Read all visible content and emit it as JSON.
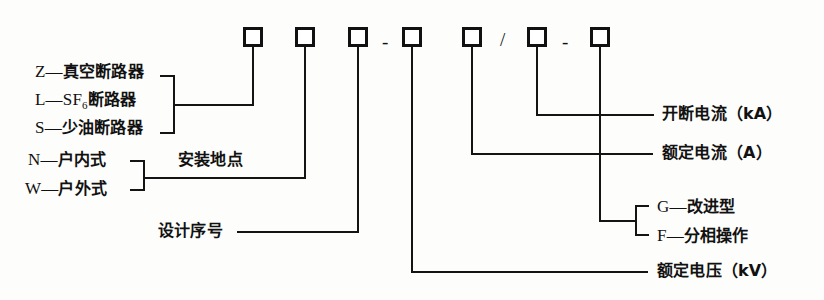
{
  "diagram": {
    "type": "callout-diagram",
    "background_color": "#fdfdfb",
    "line_color": "#141414"
  },
  "code_row": {
    "slots": [
      {
        "id": "slot-1",
        "meaning_ref": "breaker_type"
      },
      {
        "id": "slot-2",
        "meaning_ref": "install_location"
      },
      {
        "id": "slot-3",
        "meaning_ref": "design_serial"
      },
      {
        "id": "slot-4",
        "meaning_ref": "rated_voltage"
      },
      {
        "id": "slot-5",
        "meaning_ref": "rated_current"
      },
      {
        "id": "slot-6",
        "meaning_ref": "breaking_current"
      },
      {
        "id": "slot-7",
        "meaning_ref": "improvement"
      }
    ],
    "separators": [
      {
        "id": "sep-dash-1",
        "glyph": "-"
      },
      {
        "id": "sep-slash",
        "glyph": "/"
      },
      {
        "id": "sep-dash-2",
        "glyph": "-"
      }
    ]
  },
  "labels": {
    "breaker_types": [
      {
        "code": "Z",
        "dash": "—",
        "text": "真空断路器"
      },
      {
        "code": "L",
        "dash": "—",
        "text": "SF",
        "subscript": "6",
        "text_tail": "断路器"
      },
      {
        "code": "S",
        "dash": "—",
        "text": "少油断路器"
      }
    ],
    "install_types": [
      {
        "code": "N",
        "dash": "—",
        "text": "户内式"
      },
      {
        "code": "W",
        "dash": "—",
        "text": "户外式"
      }
    ],
    "install_location": "安装地点",
    "design_serial": "设计序号",
    "breaking_current": "开断电流（kA）",
    "rated_current": "额定电流（A）",
    "rated_voltage": "额定电压（kV）",
    "improvement_types": [
      {
        "code": "G",
        "dash": "—",
        "text": "改进型"
      },
      {
        "code": "F",
        "dash": "—",
        "text": "分相操作"
      }
    ]
  }
}
